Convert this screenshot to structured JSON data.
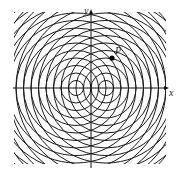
{
  "diagram": {
    "type": "wave-interference",
    "axes": {
      "x_label": "x",
      "y_label": "y",
      "origin": [
        91,
        88
      ]
    },
    "sources": [
      {
        "cx": 76,
        "cy": 88
      },
      {
        "cx": 106,
        "cy": 88
      }
    ],
    "circle_spacing": 7.5,
    "circle_count": 16,
    "clip_region": {
      "x": 14,
      "y": 12,
      "width": 152,
      "height": 152
    },
    "point": {
      "label": "P",
      "x": 112,
      "y": 58
    },
    "colors": {
      "stroke": "#1a1a1a",
      "background": "#ffffff"
    }
  }
}
